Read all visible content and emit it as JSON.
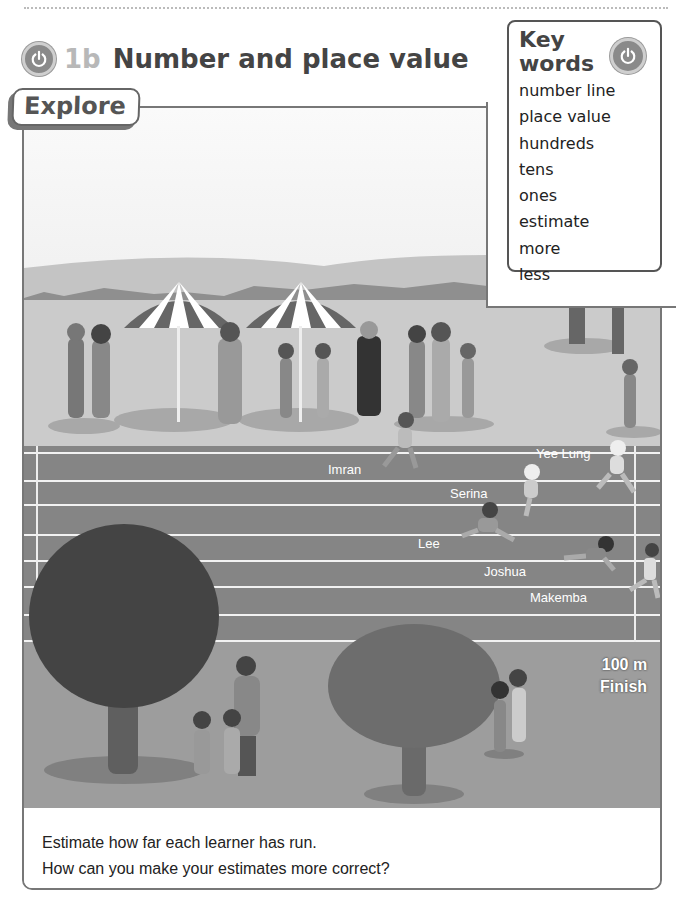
{
  "header": {
    "lesson_number": "1b",
    "lesson_title": "Number and place value",
    "icon": "power-icon"
  },
  "key_words": {
    "title_line1": "Key",
    "title_line2": "words",
    "icon": "power-icon",
    "items": [
      "number line",
      "place value",
      "hundreds",
      "tens",
      "ones",
      "estimate",
      "more",
      "less"
    ]
  },
  "explore": {
    "tab_label": "Explore",
    "scene": {
      "runners": [
        {
          "name": "Imran",
          "lane": 1
        },
        {
          "name": "Yee Lung",
          "lane": 1
        },
        {
          "name": "Serina",
          "lane": 2
        },
        {
          "name": "Lee",
          "lane": 4
        },
        {
          "name": "Joshua",
          "lane": 5
        },
        {
          "name": "Makemba",
          "lane": 6
        }
      ],
      "finish_distance": "100 m",
      "finish_label": "Finish"
    },
    "questions": [
      "Estimate how far each learner has run.",
      "How can you make your estimates more correct?"
    ]
  }
}
